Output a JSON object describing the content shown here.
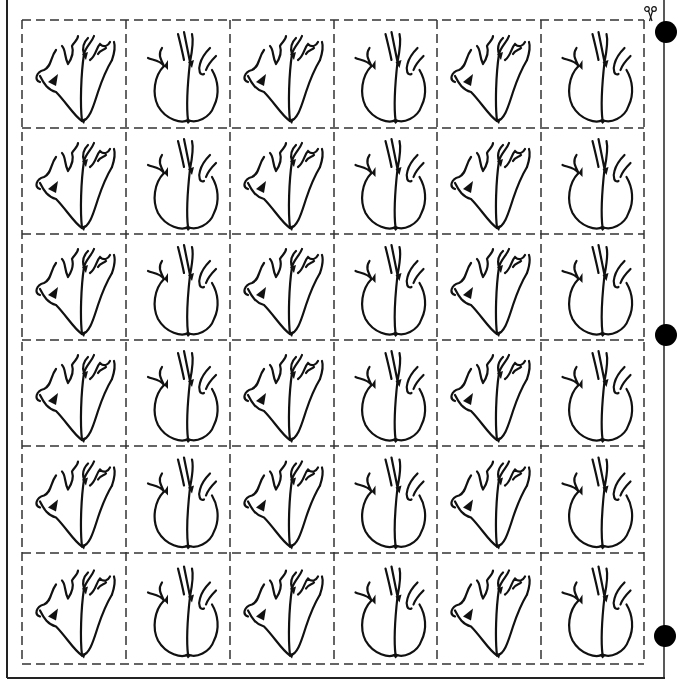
{
  "sheet": {
    "title": "Heart cutout worksheet",
    "rows": 6,
    "cols": 6,
    "column_pattern": [
      "heart-side-view",
      "heart-front-view",
      "heart-side-view",
      "heart-front-view",
      "heart-side-view",
      "heart-front-view"
    ],
    "ink_color": "#111111",
    "paper_color": "#ffffff"
  },
  "icons": {
    "scissors": "scissors-icon",
    "binder_holes": [
      "binder-hole-icon",
      "binder-hole-icon",
      "binder-hole-icon"
    ]
  }
}
